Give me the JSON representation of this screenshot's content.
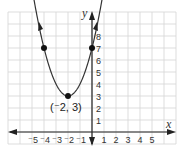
{
  "graph": {
    "title": "",
    "x_axis_label": "x",
    "y_axis_label": "y",
    "x_ticks": [
      {
        "value": -5,
        "label": "⁻5"
      },
      {
        "value": -4,
        "label": "⁻4"
      },
      {
        "value": -3,
        "label": "⁻3"
      },
      {
        "value": -2,
        "label": "⁻2"
      },
      {
        "value": -1,
        "label": "⁻1"
      },
      {
        "value": 1,
        "label": "1"
      },
      {
        "value": 2,
        "label": "2"
      },
      {
        "value": 3,
        "label": "3"
      },
      {
        "value": 4,
        "label": "4"
      },
      {
        "value": 5,
        "label": "5"
      }
    ],
    "y_ticks": [
      {
        "value": 1,
        "label": "1"
      },
      {
        "value": 2,
        "label": "2"
      },
      {
        "value": 3,
        "label": "3"
      },
      {
        "value": 4,
        "label": "4"
      },
      {
        "value": 5,
        "label": "5"
      },
      {
        "value": 6,
        "label": "6"
      },
      {
        "value": 7,
        "label": "7"
      },
      {
        "value": 8,
        "label": "8"
      }
    ],
    "vertex_label": "(⁻2, 3)",
    "curve": "parabola y = (x + 2)^2 + 3",
    "points": [
      {
        "x": -4,
        "y": 7
      },
      {
        "x": -2,
        "y": 3
      },
      {
        "x": 0,
        "y": 7
      }
    ],
    "colors": {
      "grid": "#d4d4d4",
      "axis": "#222222",
      "curve": "#333333",
      "point": "#111111"
    }
  }
}
